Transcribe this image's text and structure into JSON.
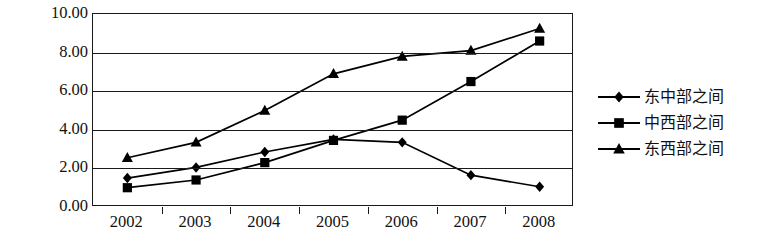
{
  "chart_data": {
    "type": "line",
    "title": "",
    "xlabel": "",
    "ylabel": "",
    "categories": [
      "2002",
      "2003",
      "2004",
      "2005",
      "2006",
      "2007",
      "2008"
    ],
    "yticks": [
      "0.00",
      "2.00",
      "4.00",
      "6.00",
      "8.00",
      "10.00"
    ],
    "ylim": [
      0,
      10
    ],
    "grid": true,
    "legend_position": "right",
    "series": [
      {
        "name": "东中部之间",
        "marker": "diamond",
        "color": "#000000",
        "values": [
          1.5,
          2.05,
          2.85,
          3.5,
          3.35,
          1.65,
          1.05
        ]
      },
      {
        "name": "中西部之间",
        "marker": "square",
        "color": "#000000",
        "values": [
          1.0,
          1.4,
          2.3,
          3.45,
          4.5,
          6.5,
          8.6
        ]
      },
      {
        "name": "东西部之间",
        "marker": "triangle",
        "color": "#000000",
        "values": [
          2.55,
          3.35,
          5.0,
          6.9,
          7.8,
          8.1,
          9.25
        ]
      }
    ]
  }
}
